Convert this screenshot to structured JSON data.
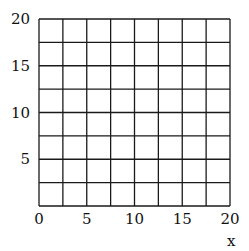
{
  "chart_data": {
    "type": "grid",
    "title": "",
    "xlabel": "x",
    "ylabel": "",
    "xlim": [
      0,
      20
    ],
    "ylim": [
      0,
      20
    ],
    "grid": true,
    "grid_step": 2.5,
    "x_ticks": [
      0,
      5,
      10,
      15,
      20
    ],
    "y_ticks": [
      5,
      10,
      15,
      20
    ],
    "x_tick_labels": [
      "0",
      "5",
      "10",
      "15",
      "20"
    ],
    "y_tick_labels": [
      "5",
      "10",
      "15",
      "20"
    ],
    "series": []
  },
  "colors": {
    "grid": "#1a1a1a",
    "background": "#ffffff",
    "text": "#111111"
  }
}
